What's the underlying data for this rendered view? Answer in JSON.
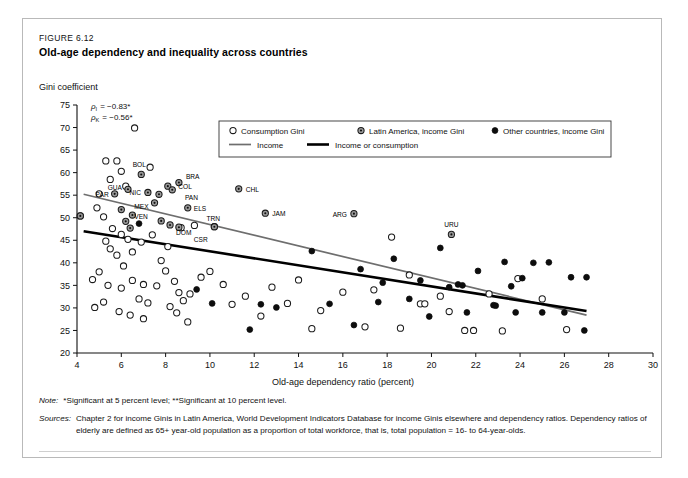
{
  "figure": {
    "number": "FIGURE 6.12",
    "title": "Old-age dependency and inequality across countries"
  },
  "notes": {
    "note_key": "Note:",
    "note_text": "*Significant at 5 percent level; **Significant at 10 percent level.",
    "sources_key": "Sources:",
    "sources_text": "Chapter 2 for income Ginis in Latin America, World Development Indicators Database for income Ginis elsewhere and dependency ratios. Dependency ratios of elderly are defined as 65+ year-old population as a proportion of total workforce, that is, total population = 16- to 64-year-olds."
  },
  "chart_data": {
    "type": "scatter",
    "title": "Old-age dependency and inequality across countries",
    "xlabel": "Old-age dependency ratio (percent)",
    "ylabel": "Gini coefficient",
    "xlim": [
      4,
      30
    ],
    "ylim": [
      20,
      75
    ],
    "xticks": [
      4,
      6,
      8,
      10,
      12,
      14,
      16,
      18,
      20,
      22,
      24,
      26,
      28,
      30
    ],
    "yticks": [
      20,
      25,
      30,
      35,
      40,
      45,
      50,
      55,
      60,
      65,
      70,
      75
    ],
    "grid": false,
    "legend_position": "top-center",
    "annotations": [
      {
        "text": "ρ",
        "sub": "I",
        "value": "= −0.83*"
      },
      {
        "text": "ρ",
        "sub": "K",
        "value": "= −0.56*"
      }
    ],
    "legend": [
      {
        "label": "Consumption Gini",
        "marker": "open-circle"
      },
      {
        "label": "Latin America, income Gini",
        "marker": "gray-circle"
      },
      {
        "label": "Other countries, income Gini",
        "marker": "filled-circle"
      },
      {
        "label": "Income",
        "marker": "line-thin-gray"
      },
      {
        "label": "Income or consumption",
        "marker": "line-thick-black"
      }
    ],
    "series": [
      {
        "name": "Consumption Gini",
        "marker": "open-circle",
        "points": [
          [
            4.15,
            50.4
          ],
          [
            5.3,
            62.6
          ],
          [
            5.8,
            62.6
          ],
          [
            6.0,
            60.3
          ],
          [
            6.6,
            69.9
          ],
          [
            5.5,
            58.5
          ],
          [
            6.2,
            57.0
          ],
          [
            7.3,
            61.2
          ],
          [
            5.0,
            55.3
          ],
          [
            4.9,
            52.2
          ],
          [
            5.2,
            50.2
          ],
          [
            5.6,
            47.6
          ],
          [
            6.0,
            46.3
          ],
          [
            5.3,
            44.8
          ],
          [
            5.5,
            43.1
          ],
          [
            6.3,
            45.2
          ],
          [
            5.8,
            41.7
          ],
          [
            6.5,
            42.4
          ],
          [
            6.9,
            44.6
          ],
          [
            7.4,
            46.2
          ],
          [
            6.1,
            39.3
          ],
          [
            5.0,
            38.0
          ],
          [
            4.7,
            36.3
          ],
          [
            5.4,
            35.0
          ],
          [
            6.0,
            34.4
          ],
          [
            6.5,
            36.1
          ],
          [
            7.0,
            35.2
          ],
          [
            7.6,
            34.9
          ],
          [
            6.8,
            32.0
          ],
          [
            7.2,
            31.1
          ],
          [
            5.2,
            31.3
          ],
          [
            4.8,
            30.1
          ],
          [
            5.9,
            29.2
          ],
          [
            6.4,
            28.4
          ],
          [
            7.0,
            27.6
          ],
          [
            8.0,
            38.2
          ],
          [
            8.4,
            35.9
          ],
          [
            8.6,
            33.4
          ],
          [
            8.8,
            31.6
          ],
          [
            8.2,
            30.3
          ],
          [
            8.5,
            28.9
          ],
          [
            9.1,
            33.1
          ],
          [
            9.6,
            36.8
          ],
          [
            9.0,
            26.9
          ],
          [
            7.8,
            40.5
          ],
          [
            8.1,
            43.6
          ],
          [
            8.7,
            47.8
          ],
          [
            9.3,
            48.3
          ],
          [
            10.2,
            48.0
          ],
          [
            10.0,
            38.1
          ],
          [
            10.6,
            35.2
          ],
          [
            11.0,
            30.8
          ],
          [
            11.6,
            32.6
          ],
          [
            12.3,
            28.2
          ],
          [
            12.8,
            34.6
          ],
          [
            13.5,
            31.0
          ],
          [
            14.0,
            36.2
          ],
          [
            15.0,
            29.4
          ],
          [
            16.0,
            33.5
          ],
          [
            17.4,
            34.0
          ],
          [
            18.2,
            45.7
          ],
          [
            19.0,
            37.3
          ],
          [
            19.5,
            30.9
          ],
          [
            19.7,
            30.9
          ],
          [
            20.4,
            32.6
          ],
          [
            20.8,
            29.2
          ],
          [
            21.5,
            25.0
          ],
          [
            21.9,
            25.0
          ],
          [
            22.6,
            33.1
          ],
          [
            23.2,
            24.9
          ],
          [
            23.9,
            36.5
          ],
          [
            25.0,
            32.0
          ],
          [
            26.1,
            25.2
          ],
          [
            18.6,
            25.5
          ],
          [
            17.0,
            25.8
          ],
          [
            14.6,
            25.4
          ]
        ]
      },
      {
        "name": "Latin America, income Gini",
        "marker": "gray-circle",
        "points": [
          [
            4.15,
            50.4
          ],
          [
            6.9,
            59.6
          ],
          [
            8.6,
            57.8
          ],
          [
            8.1,
            57.0
          ],
          [
            8.3,
            56.2
          ],
          [
            6.3,
            56.3
          ],
          [
            7.2,
            55.6
          ],
          [
            5.7,
            55.3
          ],
          [
            7.7,
            55.2
          ],
          [
            7.5,
            53.3
          ],
          [
            9.0,
            52.2
          ],
          [
            6.5,
            50.6
          ],
          [
            7.8,
            49.3
          ],
          [
            8.2,
            48.4
          ],
          [
            8.6,
            47.9
          ],
          [
            6.2,
            49.2
          ],
          [
            6.4,
            47.7
          ],
          [
            10.2,
            48.0
          ],
          [
            11.3,
            56.4
          ],
          [
            12.5,
            51.0
          ],
          [
            16.5,
            50.9
          ],
          [
            20.9,
            46.3
          ],
          [
            6.0,
            51.8
          ]
        ]
      },
      {
        "name": "Other countries, income Gini",
        "marker": "filled-circle",
        "points": [
          [
            6.8,
            48.7
          ],
          [
            9.4,
            34.1
          ],
          [
            10.1,
            31.0
          ],
          [
            12.3,
            30.8
          ],
          [
            14.6,
            42.6
          ],
          [
            16.5,
            26.2
          ],
          [
            16.8,
            38.6
          ],
          [
            17.6,
            31.3
          ],
          [
            17.8,
            35.6
          ],
          [
            18.3,
            40.9
          ],
          [
            19.0,
            32.0
          ],
          [
            19.5,
            36.1
          ],
          [
            19.9,
            28.1
          ],
          [
            20.4,
            43.3
          ],
          [
            20.8,
            34.6
          ],
          [
            21.2,
            35.2
          ],
          [
            21.4,
            35.0
          ],
          [
            21.6,
            29.0
          ],
          [
            22.1,
            38.2
          ],
          [
            22.8,
            30.6
          ],
          [
            22.9,
            30.5
          ],
          [
            23.3,
            40.2
          ],
          [
            23.6,
            34.8
          ],
          [
            23.8,
            29.0
          ],
          [
            24.1,
            36.6
          ],
          [
            24.6,
            40.0
          ],
          [
            25.3,
            40.1
          ],
          [
            25.0,
            29.0
          ],
          [
            26.0,
            29.0
          ],
          [
            26.9,
            25.0
          ],
          [
            27.0,
            36.8
          ],
          [
            26.3,
            36.8
          ],
          [
            11.8,
            25.2
          ],
          [
            13.0,
            30.1
          ],
          [
            15.4,
            30.9
          ]
        ]
      }
    ],
    "trend_lines": [
      {
        "name": "Income",
        "style": "thin-gray",
        "x0": 4.3,
        "y0": 55.2,
        "x1": 27.0,
        "y1": 28.4
      },
      {
        "name": "Income or consumption",
        "style": "thick-black",
        "x0": 4.3,
        "y0": 47.0,
        "x1": 27.0,
        "y1": 29.3
      }
    ],
    "point_labels": [
      {
        "label": "BOL",
        "x": 6.9,
        "y": 59.6,
        "dx": -2,
        "dy": -7,
        "anchor": "middle"
      },
      {
        "label": "BRA",
        "x": 8.6,
        "y": 57.8,
        "dx": 7,
        "dy": -4,
        "anchor": "start"
      },
      {
        "label": "COL",
        "x": 8.3,
        "y": 56.2,
        "dx": 6,
        "dy": -1,
        "anchor": "start"
      },
      {
        "label": "PAN",
        "x": 8.6,
        "y": 54.6,
        "dx": 6,
        "dy": 3,
        "anchor": "start"
      },
      {
        "label": "NIC",
        "x": 7.2,
        "y": 55.6,
        "dx": -7,
        "dy": 3,
        "anchor": "end"
      },
      {
        "label": "GUA",
        "x": 6.3,
        "y": 56.3,
        "dx": -6,
        "dy": 1,
        "anchor": "end"
      },
      {
        "label": "PAR",
        "x": 5.7,
        "y": 55.3,
        "dx": -6,
        "dy": 3,
        "anchor": "end"
      },
      {
        "label": "MEX",
        "x": 7.5,
        "y": 53.3,
        "dx": -6,
        "dy": 6,
        "anchor": "end"
      },
      {
        "label": "ELS",
        "x": 9.0,
        "y": 52.2,
        "dx": 6,
        "dy": 3,
        "anchor": "start"
      },
      {
        "label": "VEN",
        "x": 6.8,
        "y": 48.7,
        "dx": 2,
        "dy": -5,
        "anchor": "middle"
      },
      {
        "label": "DOM",
        "x": 8.2,
        "y": 46.8,
        "dx": 6,
        "dy": 3,
        "anchor": "start"
      },
      {
        "label": "CSR",
        "x": 9.0,
        "y": 45.3,
        "dx": 6,
        "dy": 3,
        "anchor": "start"
      },
      {
        "label": "TRN",
        "x": 10.2,
        "y": 48.0,
        "dx": -1,
        "dy": -6,
        "anchor": "middle"
      },
      {
        "label": "CHL",
        "x": 11.3,
        "y": 56.4,
        "dx": 7,
        "dy": 3,
        "anchor": "start"
      },
      {
        "label": "JAM",
        "x": 12.5,
        "y": 51.0,
        "dx": 7,
        "dy": 3,
        "anchor": "start"
      },
      {
        "label": "ARG",
        "x": 16.5,
        "y": 50.9,
        "dx": -7,
        "dy": 3,
        "anchor": "end"
      },
      {
        "label": "URU",
        "x": 20.9,
        "y": 46.3,
        "dx": 0,
        "dy": -7,
        "anchor": "middle"
      }
    ]
  }
}
